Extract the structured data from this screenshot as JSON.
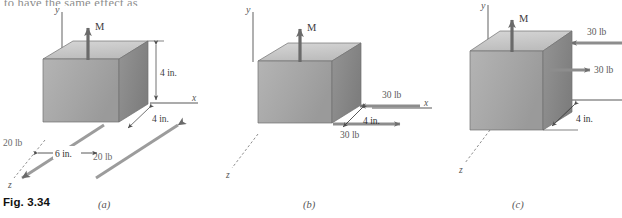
{
  "page": {
    "clipped_body_text": "to have the same effect as",
    "figure_caption": "Fig. 3.34"
  },
  "panels": [
    {
      "id": "a",
      "label": "(a)",
      "axes": {
        "y": "y",
        "x": "x",
        "z": "z"
      },
      "moment_label": "M",
      "annotations": [
        {
          "name": "height-dimension",
          "text": "4 in."
        },
        {
          "name": "depth-dimension",
          "text": "4 in."
        },
        {
          "name": "force-left-label",
          "text": "20 lb"
        },
        {
          "name": "force-right-label",
          "text": "20 lb"
        },
        {
          "name": "separation-dimension",
          "text": "6 in."
        }
      ]
    },
    {
      "id": "b",
      "label": "(b)",
      "axes": {
        "y": "y",
        "x": "x",
        "z": "z"
      },
      "moment_label": "M",
      "annotations": [
        {
          "name": "force-upper-label",
          "text": "30 lb"
        },
        {
          "name": "force-lower-label",
          "text": "30 lb"
        },
        {
          "name": "separation-dimension",
          "text": "4 in."
        }
      ]
    },
    {
      "id": "c",
      "label": "(c)",
      "axes": {
        "y": "y",
        "x": "x",
        "z": "z"
      },
      "moment_label": "M",
      "annotations": [
        {
          "name": "force-upper-label",
          "text": "30 lb"
        },
        {
          "name": "force-lower-label",
          "text": "30 lb"
        },
        {
          "name": "separation-dimension",
          "text": "4 in."
        }
      ]
    }
  ],
  "colors": {
    "box_top": "#c8c8c8",
    "box_front": "#a9a9a9",
    "box_side": "#8f8f8f",
    "arrow": "#6e6e6e",
    "axis": "#8a8a8a",
    "text": "#4a4a4a"
  }
}
